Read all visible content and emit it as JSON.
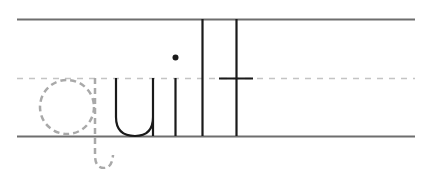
{
  "worksheet": {
    "word": "quilt",
    "traced_letter": "q",
    "solid_letters": "uilt",
    "colors": {
      "guide_line": "#6e6e6e",
      "midline_dash": "#bdbdbd",
      "trace_letter": "#a9a9a9",
      "ink": "#1a1a1a"
    }
  }
}
